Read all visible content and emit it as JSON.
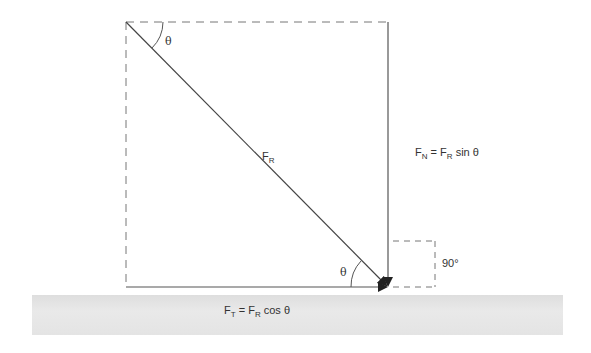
{
  "diagram": {
    "labels": {
      "theta_top": "θ",
      "theta_bottom": "θ",
      "resultant": {
        "main": "F",
        "sub": "R"
      },
      "normal": {
        "main": "F",
        "sub": "N",
        "eq": " = ",
        "rhs_main": "F",
        "rhs_sub": "R",
        "rhs_fn": " sin θ"
      },
      "tangential": {
        "main": "F",
        "sub": "T",
        "eq": " = ",
        "rhs_main": "F",
        "rhs_sub": "R",
        "rhs_fn": " cos θ"
      },
      "right_angle": "90°"
    },
    "colors": {
      "line": "#555555",
      "dashed": "#777777",
      "ground": "#e3e3e3"
    }
  }
}
